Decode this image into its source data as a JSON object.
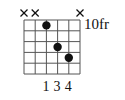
{
  "chord_diagram": {
    "type": "guitar-chord",
    "strings": 6,
    "frets_shown": 5,
    "position_label": "10fr",
    "string_states": [
      "x",
      "x",
      "fretted",
      "fretted",
      "fretted",
      "x"
    ],
    "dots": [
      {
        "string": 3,
        "fret": 1,
        "finger": "1"
      },
      {
        "string": 4,
        "fret": 3,
        "finger": "3"
      },
      {
        "string": 5,
        "fret": 4,
        "finger": "4"
      }
    ],
    "finger_labels": [
      "1",
      "3",
      "4"
    ],
    "colors": {
      "line": "#555555",
      "dot": "#111111",
      "text": "#111111",
      "background": "#ffffff"
    }
  }
}
